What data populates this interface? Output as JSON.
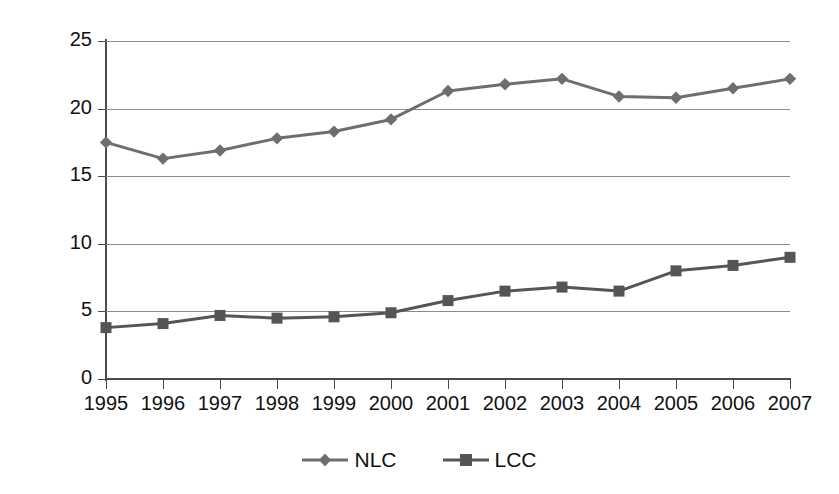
{
  "chart_data": {
    "type": "line",
    "title": "",
    "xlabel": "",
    "ylabel": "USD per Enplanement",
    "categories": [
      "1995",
      "1996",
      "1997",
      "1998",
      "1999",
      "2000",
      "2001",
      "2002",
      "2003",
      "2004",
      "2005",
      "2006",
      "2007"
    ],
    "ylim": [
      0,
      25
    ],
    "yticks": [
      0,
      5,
      10,
      15,
      20,
      25
    ],
    "ytick_labels": [
      "0",
      "5",
      "10",
      "15",
      "20",
      "25"
    ],
    "grid": "horizontal",
    "legend_position": "bottom-center",
    "series": [
      {
        "name": "NLC",
        "marker": "diamond",
        "color": "#6e6e6e",
        "values": [
          17.5,
          16.3,
          16.9,
          17.8,
          18.3,
          19.2,
          21.3,
          21.8,
          22.2,
          20.9,
          20.8,
          21.5,
          22.2
        ]
      },
      {
        "name": "LCC",
        "marker": "square",
        "color": "#555555",
        "values": [
          3.8,
          4.1,
          4.7,
          4.5,
          4.6,
          4.9,
          5.8,
          6.5,
          6.8,
          6.5,
          8.0,
          8.4,
          9.0
        ]
      }
    ]
  },
  "legend": {
    "items": [
      {
        "label": "NLC",
        "marker": "diamond-marker-icon"
      },
      {
        "label": "LCC",
        "marker": "square-marker-icon"
      }
    ]
  },
  "colors": {
    "nlc": "#6e6e6e",
    "lcc": "#555555",
    "axis": "#4a4a4a",
    "grid": "#8d8d8d",
    "text": "#111111",
    "background": "#ffffff"
  }
}
